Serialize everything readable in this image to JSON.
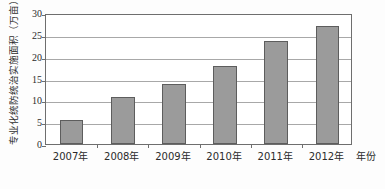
{
  "chart_data": {
    "type": "bar",
    "title": "",
    "subtitle": "",
    "categories": [
      "2007年",
      "2008年",
      "2009年",
      "2010年",
      "2011年",
      "2012年"
    ],
    "values": [
      5.4,
      10.8,
      13.8,
      17.8,
      23.7,
      27.1
    ],
    "series": [
      {
        "name": "专业化统防统治实施面积",
        "values": [
          5.4,
          10.8,
          13.8,
          17.8,
          23.7,
          27.1
        ]
      }
    ],
    "xlabel": "年份",
    "ylabel": "专业化统防统治实施面积（万亩）",
    "ylim": [
      0,
      30
    ],
    "yticks": [
      0,
      5,
      10,
      15,
      20,
      25,
      30
    ],
    "ytick_labels": [
      "0",
      "5",
      "10",
      "15",
      "20",
      "25",
      "30"
    ],
    "grid": true,
    "grid_axis": "y",
    "legend": false,
    "legend_position": "none",
    "bar_color": "#9b9b9b",
    "bar_edge_color": "#5d5d5d",
    "grid_color": "#a8a8a8",
    "frame_color": "#6e6e6e",
    "background_color": "#ffffff",
    "annotations": []
  }
}
